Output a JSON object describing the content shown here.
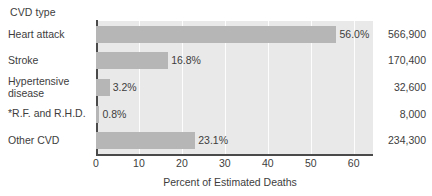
{
  "chart_data": {
    "type": "bar",
    "orientation": "horizontal",
    "title": "",
    "group_title": "CVD type",
    "xlabel": "Percent of Estimated Deaths",
    "ylabel": "CVD type",
    "xlim": [
      0,
      64.5
    ],
    "xticks": [
      "0",
      "10",
      "20",
      "30",
      "40",
      "50",
      "60"
    ],
    "xtick_values": [
      0,
      10,
      20,
      30,
      40,
      50,
      60
    ],
    "grid": "vertical-white",
    "legend": "none",
    "categories": [
      "Heart attack",
      "Stroke",
      "Hypertensive\ndisease",
      "*R.F. and R.H.D.",
      "Other CVD"
    ],
    "values": [
      56.0,
      16.8,
      3.2,
      0.8,
      23.1
    ],
    "value_labels": [
      "56.0%",
      "16.8%",
      "3.2%",
      "0.8%",
      "23.1%"
    ],
    "counts": [
      "566,900",
      "170,400",
      "32,600",
      "8,000",
      "234,300"
    ],
    "count_values": [
      566900,
      170400,
      32600,
      8000,
      234300
    ],
    "bar_color": "#b6b6b6",
    "plot_background": "#e9e9e9",
    "axis_color": "#4a4a4a",
    "gridline_color": "#fdfdfd",
    "text_color": "#3d3d3d"
  }
}
